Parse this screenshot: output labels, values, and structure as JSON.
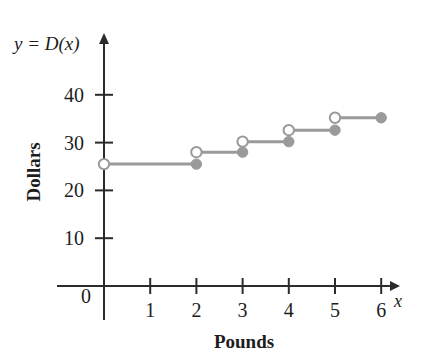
{
  "chart_data": {
    "type": "line",
    "subtype": "step-function",
    "title": "",
    "xlabel": "Pounds",
    "ylabel": "Dollars",
    "function_label": "y = D(x)",
    "x_axis_variable": "x",
    "origin_label": "0",
    "xlim": [
      0,
      6.6
    ],
    "ylim": [
      0,
      44
    ],
    "x_ticks": [
      1,
      2,
      3,
      4,
      5,
      6
    ],
    "x_tick_labels": [
      "1",
      "2",
      "3",
      "4",
      "5",
      "6"
    ],
    "y_ticks": [
      10,
      20,
      30,
      40
    ],
    "y_tick_labels": [
      "10",
      "20",
      "30",
      "40"
    ],
    "grid": false,
    "legend": null,
    "line_color": "#9a9a9a",
    "axis_color": "#2b2b2b",
    "background_color": "#ffffff",
    "steps": [
      {
        "x_start": 0,
        "x_end": 2,
        "y": 25.5,
        "left_endpoint": "open",
        "right_endpoint": "closed"
      },
      {
        "x_start": 2,
        "x_end": 3,
        "y": 28.0,
        "left_endpoint": "open",
        "right_endpoint": "closed"
      },
      {
        "x_start": 3,
        "x_end": 4,
        "y": 30.2,
        "left_endpoint": "open",
        "right_endpoint": "closed"
      },
      {
        "x_start": 4,
        "x_end": 5,
        "y": 32.6,
        "left_endpoint": "open",
        "right_endpoint": "closed"
      },
      {
        "x_start": 5,
        "x_end": 6,
        "y": 35.2,
        "left_endpoint": "open",
        "right_endpoint": "closed"
      }
    ]
  }
}
